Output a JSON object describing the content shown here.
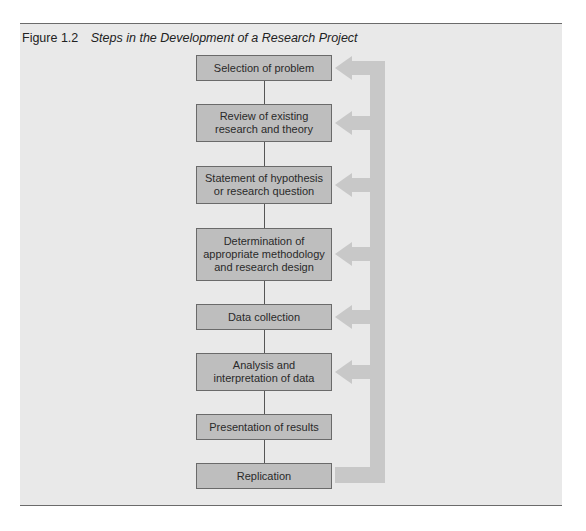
{
  "figure": {
    "number": "Figure 1.2",
    "caption": "Steps in the Development of a Research Project"
  },
  "steps": [
    {
      "label": "Selection of problem",
      "top": 55,
      "height": 26
    },
    {
      "label": "Review of existing\nresearch and theory",
      "top": 104,
      "height": 38
    },
    {
      "label": "Statement of hypothesis\nor research question",
      "top": 166,
      "height": 38
    },
    {
      "label": "Determination of\nappropriate methodology\nand research design",
      "top": 228,
      "height": 53
    },
    {
      "label": "Data collection",
      "top": 304,
      "height": 26
    },
    {
      "label": "Analysis and\ninterpretation of data",
      "top": 353,
      "height": 38
    },
    {
      "label": "Presentation of results",
      "top": 414,
      "height": 26
    },
    {
      "label": "Replication",
      "top": 463,
      "height": 26
    }
  ],
  "colors": {
    "panel": "#e9e9e9",
    "box_fill": "#bebebe",
    "box_border": "#6a6a6a",
    "feedback_arrow": "#c8c8c8"
  }
}
